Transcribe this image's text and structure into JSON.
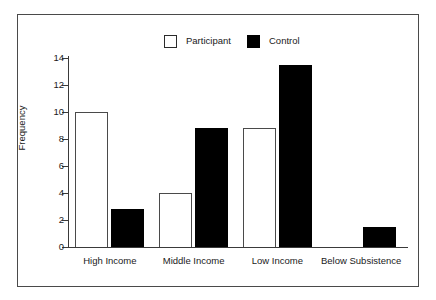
{
  "chart_data": {
    "type": "bar",
    "title": "",
    "subtitle": "",
    "xlabel": "",
    "ylabel": "Frequency",
    "categories": [
      "High Income",
      "Middle Income",
      "Low Income",
      "Below Subsistence"
    ],
    "series": [
      {
        "name": "Participant",
        "style": "hollow",
        "values": [
          10,
          4,
          8.8,
          0
        ]
      },
      {
        "name": "Control",
        "style": "filled",
        "values": [
          2.8,
          8.8,
          13.5,
          1.5
        ]
      }
    ],
    "ylim": [
      0,
      14
    ],
    "yticks": [
      0,
      2,
      4,
      6,
      8,
      10,
      12,
      14
    ],
    "ytick_labels": [
      "0",
      "2",
      "4",
      "6",
      "8",
      "10",
      "12",
      "14"
    ],
    "grid": false,
    "legend_position": "top-center",
    "legend": [
      {
        "label": "Participant",
        "swatch": "hollow-square"
      },
      {
        "label": "Control",
        "swatch": "filled-square"
      }
    ],
    "colors": {
      "participant_fill": "#ffffff",
      "participant_edge": "#4a4a4a",
      "control_fill": "#000000",
      "axis": "#3a3a3a",
      "frame": "#4a4a4a",
      "text": "#1a1a1a",
      "background": "#ffffff"
    }
  }
}
